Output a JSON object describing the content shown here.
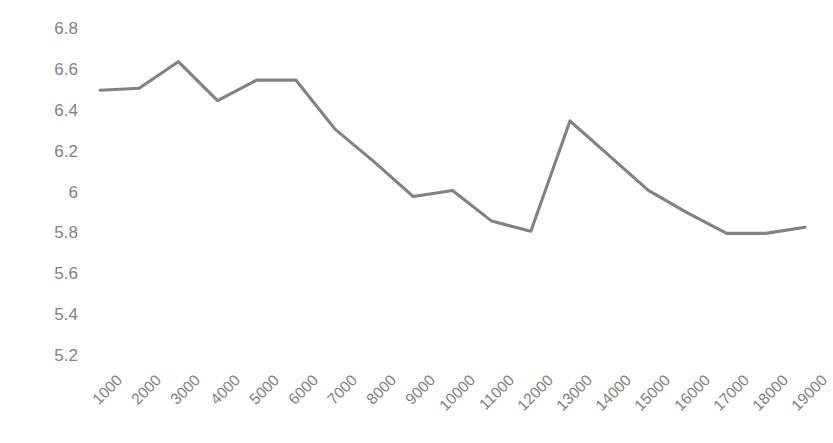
{
  "chart_data": {
    "type": "line",
    "title": "",
    "subtitle": "",
    "xlabel": "",
    "ylabel": "",
    "categories": [
      "1000",
      "2000",
      "3000",
      "4000",
      "5000",
      "6000",
      "7000",
      "8000",
      "9000",
      "10000",
      "11000",
      "12000",
      "13000",
      "14000",
      "15000",
      "16000",
      "17000",
      "18000",
      "19000"
    ],
    "values": [
      6.5,
      6.51,
      6.64,
      6.45,
      6.55,
      6.55,
      6.31,
      6.15,
      5.98,
      6.01,
      5.86,
      5.81,
      6.35,
      6.18,
      6.01,
      5.9,
      5.8,
      5.8,
      5.83
    ],
    "series": [
      {
        "name": "series-1",
        "values": [
          6.5,
          6.51,
          6.64,
          6.45,
          6.55,
          6.55,
          6.31,
          6.15,
          5.98,
          6.01,
          5.86,
          5.81,
          6.35,
          6.18,
          6.01,
          5.9,
          5.8,
          5.8,
          5.83
        ],
        "color": "#808284"
      }
    ],
    "ylim": [
      5.2,
      6.8
    ],
    "yticks": [
      "6.8",
      "6.6",
      "6.4",
      "6.2",
      "6",
      "5.8",
      "5.6",
      "5.4",
      "5.2"
    ],
    "ytick_values": [
      6.8,
      6.6,
      6.4,
      6.2,
      6.0,
      5.8,
      5.6,
      5.4,
      5.2
    ],
    "grid": false,
    "legend": false,
    "legend_position": "none",
    "line_color": "#808284",
    "tick_label_color": "#808284",
    "background_color": "#ffffff",
    "x_tick_rotation": -45
  }
}
